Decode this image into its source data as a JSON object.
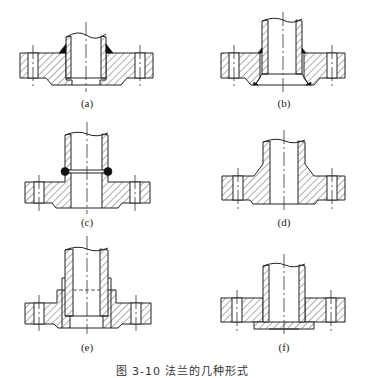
{
  "figure": {
    "caption": "图 3-10   法兰的几种形式",
    "panels": [
      {
        "id": "a",
        "label": "(a)",
        "type": "flat-welded flange with inner and outer fillet welds"
      },
      {
        "id": "b",
        "label": "(b)",
        "type": "flat-welded flange with beveled weld"
      },
      {
        "id": "c",
        "label": "(c)",
        "type": "hubbed flange butt-welded to pipe"
      },
      {
        "id": "d",
        "label": "(d)",
        "type": "integral hubbed (weld-neck) flange"
      },
      {
        "id": "e",
        "label": "(e)",
        "type": "threaded / socket hubbed flange"
      },
      {
        "id": "f",
        "label": "(f)",
        "type": "loose (lap-joint) flange"
      }
    ]
  }
}
